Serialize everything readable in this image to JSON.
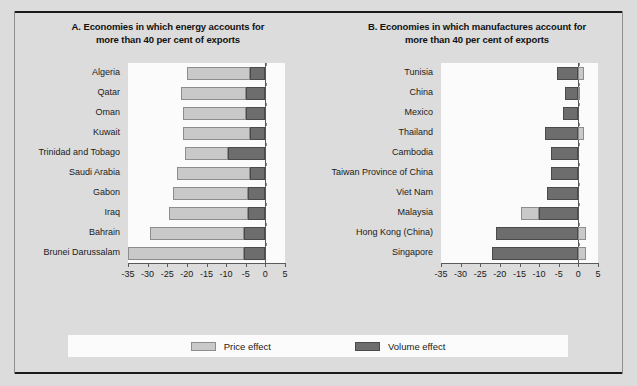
{
  "figure": {
    "background_color": "#dcdcdc",
    "panel_background_color": "#fbfbfb",
    "price_color": "#c9c9c9",
    "volume_color": "#6d6d6d"
  },
  "legend": {
    "items": [
      {
        "label": "Price effect",
        "key": "price",
        "color": "#c9c9c9"
      },
      {
        "label": "Volume effect",
        "key": "volume",
        "color": "#6d6d6d"
      }
    ]
  },
  "chart_data": [
    {
      "type": "bar",
      "orientation": "horizontal",
      "stacked": true,
      "panel": "A",
      "title": "A. Economies in which energy accounts for more than 40 per cent of exports",
      "title_line1": "A. Economies in which energy accounts for",
      "title_line2": "more than 40 per cent of exports",
      "xlabel": "",
      "ylabel": "",
      "xlim": [
        -35,
        5
      ],
      "xticks": [
        -35,
        -30,
        -25,
        -20,
        -15,
        -10,
        -5,
        0,
        5
      ],
      "xtick_labels": [
        "-35",
        "-30",
        "-25",
        "-20",
        "-15",
        "-10",
        "-5",
        "0",
        "5"
      ],
      "grid": false,
      "legend_position": "bottom",
      "categories": [
        "Algeria",
        "Qatar",
        "Oman",
        "Kuwait",
        "Trinidad and Tobago",
        "Saudi Arabia",
        "Gabon",
        "Iraq",
        "Bahrain",
        "Brunei Darussalam"
      ],
      "series": [
        {
          "name": "Price effect",
          "values": [
            -16.0,
            -16.5,
            -16.0,
            -17.0,
            -11.0,
            -18.5,
            -19.0,
            -20.0,
            -24.0,
            -29.5
          ]
        },
        {
          "name": "Volume effect",
          "values": [
            -4.0,
            -5.0,
            -5.0,
            -4.0,
            -9.5,
            -4.0,
            -4.5,
            -4.5,
            -5.5,
            -5.5
          ]
        }
      ],
      "totals": [
        -20.0,
        -21.5,
        -21.0,
        -21.0,
        -20.5,
        -22.5,
        -23.5,
        -24.5,
        -29.5,
        -35.0
      ]
    },
    {
      "type": "bar",
      "orientation": "horizontal",
      "stacked": true,
      "panel": "B",
      "title": "B. Economies in which manufactures account for more than 40 per cent of exports",
      "title_line1": "B. Economies in which manufactures account for",
      "title_line2": "more than 40 per cent of exports",
      "xlabel": "",
      "ylabel": "",
      "xlim": [
        -35,
        5
      ],
      "xticks": [
        -35,
        -30,
        -25,
        -20,
        -15,
        -10,
        -5,
        0,
        5
      ],
      "xtick_labels": [
        "-35",
        "-30",
        "-25",
        "-20",
        "-15",
        "-10",
        "-5",
        "0",
        "5"
      ],
      "grid": false,
      "legend_position": "bottom",
      "categories": [
        "Tunisia",
        "China",
        "Mexico",
        "Thailand",
        "Cambodia",
        "Taiwan Province of China",
        "Viet Nam",
        "Malaysia",
        "Hong Kong (China)",
        "Singapore"
      ],
      "series": [
        {
          "name": "Price effect",
          "values": [
            1.5,
            0.5,
            0.0,
            1.5,
            0.0,
            0.0,
            0.0,
            -4.5,
            2.0,
            2.0
          ]
        },
        {
          "name": "Volume effect",
          "values": [
            -5.5,
            -3.5,
            -4.0,
            -8.5,
            -7.0,
            -7.0,
            -8.0,
            -10.0,
            -21.0,
            -22.0
          ]
        }
      ],
      "totals": [
        -4.0,
        -3.0,
        -4.0,
        -7.0,
        -7.0,
        -7.0,
        -8.0,
        -14.5,
        -19.0,
        -20.0
      ]
    }
  ]
}
